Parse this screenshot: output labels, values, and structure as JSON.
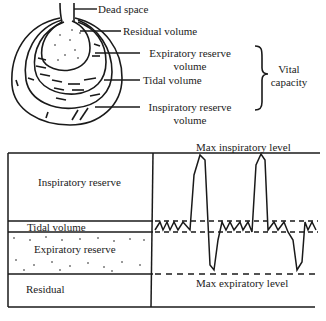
{
  "top_diagram": {
    "labels": {
      "dead_space": "Dead space",
      "residual_volume": "Residual volume",
      "expiratory_reserve_l1": "Expiratory reserve",
      "expiratory_reserve_l2": "volume",
      "tidal_volume": "Tidal volume",
      "inspiratory_reserve_l1": "Inspiratory reserve",
      "inspiratory_reserve_l2": "volume",
      "vital_l1": "Vital",
      "vital_l2": "capacity"
    }
  },
  "bottom_diagram": {
    "blocks": {
      "inspiratory_reserve": "Inspiratory reserve",
      "tidal_volume": "Tidal volume",
      "expiratory_reserve": "Expiratory reserve",
      "residual": "Residual"
    },
    "levels": {
      "max_inspiratory": "Max inspiratory level",
      "max_expiratory": "Max expiratory level"
    }
  }
}
